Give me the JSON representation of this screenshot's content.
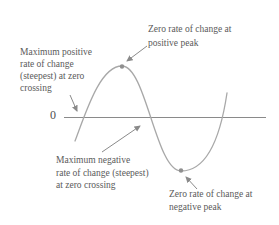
{
  "diagram": {
    "colors": {
      "background": "#ffffff",
      "curve": "#a8a8a8",
      "axis": "#8a8a8a",
      "arrow": "#8a8a8a",
      "dot": "#8f8f8f",
      "text": "#5a5a5a"
    },
    "axis": {
      "zero_label": "0"
    },
    "annotations": {
      "positive_peak": {
        "lines": [
          "Zero rate of change at",
          "positive peak"
        ]
      },
      "max_positive": {
        "lines": [
          "Maximum positive",
          "rate of change",
          "(steepest) at zero",
          "crossing"
        ]
      },
      "max_negative": {
        "lines": [
          "Maximum negative",
          "rate of change (steepest)",
          "at zero crossing"
        ]
      },
      "negative_peak": {
        "lines": [
          "Zero rate of change at",
          "negative peak"
        ]
      }
    }
  }
}
